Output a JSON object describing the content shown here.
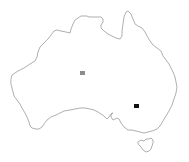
{
  "map": {
    "region": "Australia",
    "background_color": "#ffffff",
    "outline_color": "#9a9a9a",
    "landmasses": [
      {
        "name": "Mainland Australia"
      },
      {
        "name": "Tasmania"
      }
    ],
    "markers": [
      {
        "id": "marker-central",
        "shape": "square",
        "color": "#8c8c8c",
        "x": 80,
        "y": 71,
        "w": 5,
        "h": 4
      },
      {
        "id": "marker-southeast",
        "shape": "square",
        "color": "#111111",
        "x": 134,
        "y": 104,
        "w": 5,
        "h": 4
      }
    ]
  }
}
